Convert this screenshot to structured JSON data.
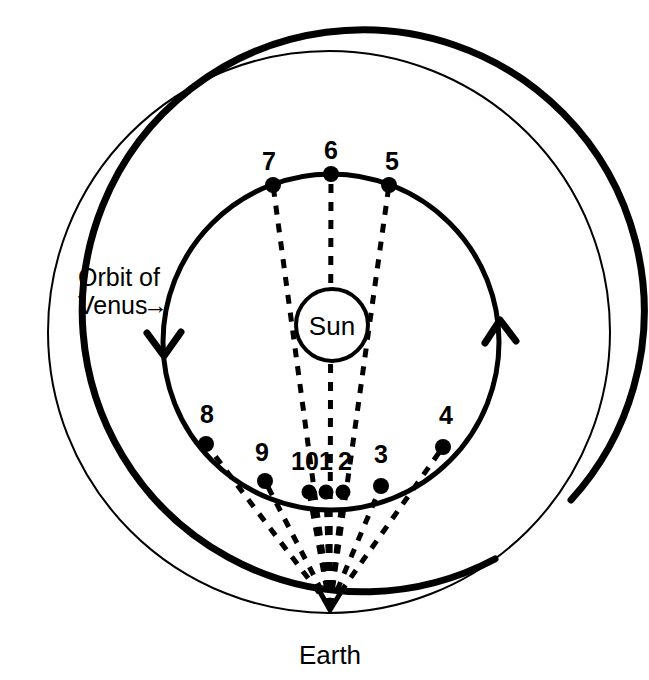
{
  "diagram": {
    "background_color": "#ffffff",
    "stroke_color": "#000000",
    "labels": {
      "sun": "Sun",
      "earth": "Earth",
      "orbit_of_venus_line1": "Orbit of",
      "orbit_of_venus_line2": "Venus",
      "orbit_arrow_glyph": "→"
    },
    "bodies": {
      "sun": {
        "label": "Sun",
        "cx": 332,
        "cy": 325,
        "r": 36
      },
      "earth": {
        "label": "Earth",
        "x": 330,
        "y": 608
      }
    },
    "orbits": [
      {
        "name": "earth-orbit",
        "label": "Earth orbit (outer circle)",
        "cx": 329,
        "cy": 332,
        "r": 281,
        "stroke_width_thick": 7,
        "stroke_width_thin": 2
      },
      {
        "name": "venus-orbit",
        "label": "Orbit of Venus",
        "cx": 331,
        "cy": 342,
        "r": 168,
        "stroke_width": 5,
        "direction": "counterclockwise"
      }
    ],
    "direction_arrows": [
      {
        "name": "venus-direction-arrow-left",
        "x": 163,
        "y": 352,
        "points_to": "down"
      },
      {
        "name": "venus-direction-arrow-right",
        "x": 499,
        "y": 325,
        "points_to": "up"
      }
    ],
    "venus_positions": [
      {
        "label": "1",
        "x": 326,
        "y": 492,
        "label_x": 326,
        "label_y": 470
      },
      {
        "label": "2",
        "x": 343,
        "y": 492,
        "label_x": 344,
        "label_y": 470
      },
      {
        "label": "3",
        "x": 381,
        "y": 486,
        "label_x": 381,
        "label_y": 463
      },
      {
        "label": "4",
        "x": 443,
        "y": 447,
        "label_x": 445,
        "label_y": 424
      },
      {
        "label": "5",
        "x": 389,
        "y": 185,
        "label_x": 391,
        "label_y": 170
      },
      {
        "label": "6",
        "x": 331,
        "y": 174,
        "label_x": 331,
        "label_y": 159
      },
      {
        "label": "7",
        "x": 273,
        "y": 185,
        "label_x": 270,
        "label_y": 170
      },
      {
        "label": "8",
        "x": 206,
        "y": 444,
        "label_x": 207,
        "label_y": 422
      },
      {
        "label": "9",
        "x": 265,
        "y": 481,
        "label_x": 263,
        "label_y": 461
      },
      {
        "label": "10",
        "x": 309,
        "y": 492,
        "label_x": 307,
        "label_y": 470
      }
    ],
    "sight_lines": {
      "name": "lines-of-sight-from-earth",
      "style": "dashed",
      "dash_pattern": "9 9",
      "stroke_width": 5,
      "converge_at": {
        "x": 330,
        "y": 607
      }
    }
  }
}
